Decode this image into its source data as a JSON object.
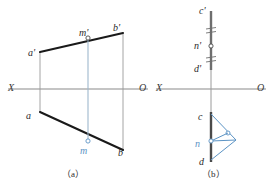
{
  "figure": {
    "colors": {
      "outline": "#2b2b2b",
      "heavy_line": "#1a1a1a",
      "axis": "#8a8a8a",
      "projector": "#9fb8cd",
      "construction_blue": "#5b93c4",
      "background": "#ffffff"
    },
    "panels": [
      {
        "id": "panel-a",
        "caption": "（a）",
        "axis": {
          "left_label": "X",
          "right_label": "O",
          "y": 89,
          "x_start": 8,
          "x_end": 148
        },
        "labels": [
          {
            "name": "a-prime",
            "text": "a'",
            "x": 28,
            "y": 48,
            "blue": false
          },
          {
            "name": "m-prime",
            "text": "m'",
            "x": 79,
            "y": 28,
            "blue": false
          },
          {
            "name": "b-prime",
            "text": "b'",
            "x": 113,
            "y": 23,
            "blue": false
          },
          {
            "name": "a",
            "text": "a",
            "x": 26,
            "y": 111,
            "blue": false
          },
          {
            "name": "m",
            "text": "m",
            "x": 80,
            "y": 146,
            "blue": true
          },
          {
            "name": "b",
            "text": "b",
            "x": 118,
            "y": 148,
            "blue": false
          }
        ],
        "points": [
          {
            "name": "m-prime-point",
            "x": 88,
            "y": 38
          },
          {
            "name": "m-point",
            "x": 88,
            "y": 141
          }
        ]
      },
      {
        "id": "panel-b",
        "caption": "（b）",
        "axis": {
          "left_label": "X",
          "right_label": "O",
          "y": 89,
          "x_start": 156,
          "x_end": 266
        },
        "labels": [
          {
            "name": "c-prime",
            "text": "c'",
            "x": 199,
            "y": 6,
            "blue": false
          },
          {
            "name": "n-prime",
            "text": "n'",
            "x": 194,
            "y": 41,
            "blue": false
          },
          {
            "name": "d-prime",
            "text": "d'",
            "x": 194,
            "y": 64,
            "blue": false
          },
          {
            "name": "c",
            "text": "c",
            "x": 198,
            "y": 112,
            "blue": false
          },
          {
            "name": "n",
            "text": "n",
            "x": 195,
            "y": 139,
            "blue": true
          },
          {
            "name": "d",
            "text": "d",
            "x": 199,
            "y": 157,
            "blue": false
          }
        ],
        "points": [
          {
            "name": "n-prime-point",
            "x": 211,
            "y": 46
          },
          {
            "name": "n-point",
            "x": 211,
            "y": 141
          },
          {
            "name": "aux-point",
            "x": 228,
            "y": 133
          }
        ],
        "tick_marks": {
          "name": "equal-length-ticks",
          "count": 4,
          "description": "double hash marks above and below n' indicating equal segments"
        }
      }
    ]
  }
}
